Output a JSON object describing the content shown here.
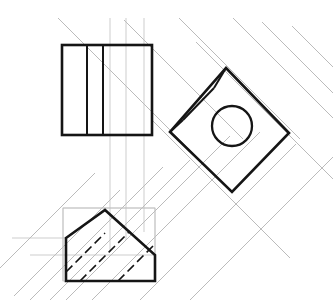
{
  "drawing": {
    "title": "Orthographic Projection Construction",
    "canvas": {
      "width": 333,
      "height": 300,
      "background": "#ffffff"
    },
    "colors": {
      "outline": "#151515",
      "construction": "#a9a9a9",
      "construction_faint": "#c0c0c0",
      "background": "#ffffff"
    },
    "views": {
      "top_view": {
        "label": "top-view-rectangle",
        "shape": "rectangle",
        "x": 62,
        "y": 45,
        "width": 90,
        "height": 90,
        "internal_vertical_lines": [
          87,
          103
        ]
      },
      "auxiliary_view": {
        "label": "auxiliary-diamond-view",
        "shape": "rotated-square",
        "vertices": [
          {
            "x": 226,
            "y": 68
          },
          {
            "x": 289,
            "y": 133
          },
          {
            "x": 232,
            "y": 192
          },
          {
            "x": 170,
            "y": 132
          }
        ],
        "inner_offset_line": [
          {
            "x": 185,
            "y": 118
          },
          {
            "x": 213,
            "y": 90
          }
        ],
        "circle": {
          "cx": 232,
          "cy": 126,
          "r": 20
        }
      },
      "front_view": {
        "label": "front-view-pentagon",
        "shape": "chamfered-polygon",
        "vertices": [
          {
            "x": 66,
            "y": 238
          },
          {
            "x": 105,
            "y": 210
          },
          {
            "x": 155,
            "y": 255
          },
          {
            "x": 155,
            "y": 281
          },
          {
            "x": 66,
            "y": 281
          }
        ],
        "bounding_box": {
          "x": 63,
          "y": 208,
          "width": 92,
          "height": 73
        },
        "hidden_lines": [
          [
            {
              "x": 66,
              "y": 272
            },
            {
              "x": 105,
              "y": 233
            }
          ],
          [
            {
              "x": 80,
              "y": 281
            },
            {
              "x": 130,
              "y": 231
            }
          ],
          [
            {
              "x": 118,
              "y": 281
            },
            {
              "x": 155,
              "y": 244
            }
          ]
        ]
      }
    },
    "construction_lines": {
      "vertical_projectors": [
        110,
        126,
        144
      ],
      "diagonal_angle_degrees": 45,
      "diagonal_count": 12,
      "horizontal_projectors": [
        211,
        238,
        255,
        281
      ]
    }
  }
}
